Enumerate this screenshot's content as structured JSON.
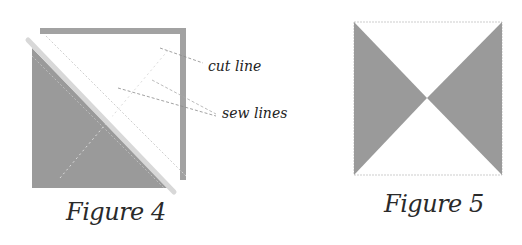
{
  "colors": {
    "fabric_dark": "#9a9a9a",
    "border": "#a2a2a2",
    "cut_strip": "#d8d8d8",
    "sew_line": "#c8c8c8",
    "leader_line": "#8a8a8a",
    "outline": "#c0c0c0"
  },
  "figure4": {
    "caption": "Figure 4",
    "labels": {
      "cut_line": "cut line",
      "sew_lines": "sew lines"
    }
  },
  "figure5": {
    "caption": "Figure 5"
  }
}
